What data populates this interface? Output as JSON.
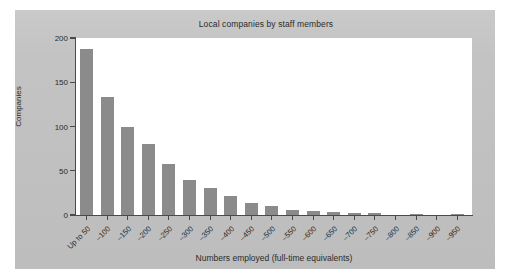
{
  "chart_data": {
    "type": "bar",
    "title": "Local companies by staff members",
    "xlabel": "Numbers employed (full-time equivalents)",
    "ylabel": "Companies",
    "categories": [
      "Up to 50",
      "–100",
      "–150",
      "–200",
      "–250",
      "–300",
      "–350",
      "–400",
      "–450",
      "–500",
      "–550",
      "–600",
      "–650",
      "–700",
      "–750",
      "–800",
      "–850",
      "–900",
      "–950"
    ],
    "values": [
      188,
      133,
      99,
      80,
      58,
      40,
      30,
      22,
      14,
      10,
      6,
      4,
      3,
      2,
      2,
      0,
      1,
      0,
      1
    ],
    "ylim": [
      0,
      200
    ],
    "yticks": [
      0,
      50,
      100,
      150,
      200
    ],
    "ytick_labels": [
      "0",
      "50",
      "100",
      "150",
      "200"
    ],
    "grid": false,
    "legend": null,
    "bar_color": "#8b8b8b",
    "plot_background": "#ffffff",
    "figure_background": "#c3c3c3",
    "axis_color": "#4a4a4a",
    "text_color": "#2b2b2b"
  }
}
